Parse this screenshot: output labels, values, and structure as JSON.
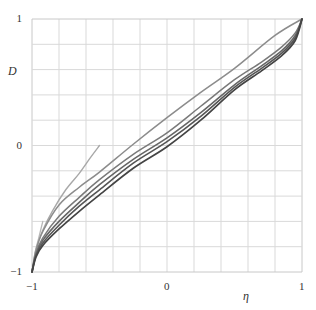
{
  "chart_data": {
    "type": "line",
    "title": "",
    "xlabel": "η",
    "ylabel": "D",
    "xlim": [
      -1,
      1
    ],
    "ylim": [
      -1,
      1
    ],
    "grid": true,
    "grid_divisions": {
      "x": 10,
      "y": 10
    },
    "x_ticks": [
      {
        "value": -1,
        "label": "−1"
      },
      {
        "value": 0,
        "label": "0"
      },
      {
        "value": 1,
        "label": "1"
      }
    ],
    "y_ticks": [
      {
        "value": -1,
        "label": "−1"
      },
      {
        "value": 0,
        "label": "0"
      },
      {
        "value": 1,
        "label": "1"
      }
    ],
    "legend": null,
    "series": [
      {
        "name": "curve-1",
        "color": "#b8b8b8",
        "width": 1.3,
        "points": [
          [
            -1,
            -1
          ],
          [
            -0.98,
            -0.86
          ],
          [
            -0.95,
            -0.73
          ],
          [
            -0.92,
            -0.6
          ]
        ]
      },
      {
        "name": "curve-2",
        "color": "#a8a8a8",
        "width": 1.4,
        "points": [
          [
            -1,
            -1
          ],
          [
            -0.97,
            -0.82
          ],
          [
            -0.92,
            -0.67
          ],
          [
            -0.85,
            -0.52
          ],
          [
            -0.75,
            -0.35
          ],
          [
            -0.65,
            -0.22
          ],
          [
            -0.57,
            -0.1
          ],
          [
            -0.5,
            0.0
          ]
        ]
      },
      {
        "name": "curve-3",
        "color": "#8c8c8c",
        "width": 1.5,
        "points": [
          [
            -1,
            -1
          ],
          [
            -0.97,
            -0.83
          ],
          [
            -0.92,
            -0.68
          ],
          [
            -0.8,
            -0.47
          ],
          [
            -0.65,
            -0.33
          ],
          [
            -0.5,
            -0.21
          ],
          [
            -0.25,
            0.01
          ],
          [
            0,
            0.22
          ],
          [
            0.25,
            0.42
          ],
          [
            0.5,
            0.61
          ],
          [
            0.8,
            0.87
          ],
          [
            1,
            1
          ]
        ]
      },
      {
        "name": "curve-4",
        "color": "#7a7a7a",
        "width": 1.5,
        "points": [
          [
            -1,
            -1
          ],
          [
            -0.97,
            -0.85
          ],
          [
            -0.92,
            -0.73
          ],
          [
            -0.8,
            -0.56
          ],
          [
            -0.65,
            -0.41
          ],
          [
            -0.5,
            -0.27
          ],
          [
            -0.25,
            -0.07
          ],
          [
            0,
            0.1
          ],
          [
            0.25,
            0.31
          ],
          [
            0.5,
            0.52
          ],
          [
            0.7,
            0.66
          ],
          [
            0.85,
            0.78
          ],
          [
            0.95,
            0.89
          ],
          [
            1,
            1
          ]
        ]
      },
      {
        "name": "curve-5",
        "color": "#666666",
        "width": 1.6,
        "points": [
          [
            -1,
            -1
          ],
          [
            -0.97,
            -0.86
          ],
          [
            -0.92,
            -0.75
          ],
          [
            -0.8,
            -0.6
          ],
          [
            -0.65,
            -0.45
          ],
          [
            -0.5,
            -0.31
          ],
          [
            -0.25,
            -0.11
          ],
          [
            0,
            0.06
          ],
          [
            0.25,
            0.26
          ],
          [
            0.5,
            0.48
          ],
          [
            0.7,
            0.63
          ],
          [
            0.85,
            0.75
          ],
          [
            0.95,
            0.87
          ],
          [
            1,
            1
          ]
        ]
      },
      {
        "name": "curve-6",
        "color": "#555555",
        "width": 1.6,
        "points": [
          [
            -1,
            -1
          ],
          [
            -0.97,
            -0.87
          ],
          [
            -0.92,
            -0.77
          ],
          [
            -0.8,
            -0.63
          ],
          [
            -0.65,
            -0.48
          ],
          [
            -0.5,
            -0.35
          ],
          [
            -0.25,
            -0.14
          ],
          [
            0,
            0.03
          ],
          [
            0.25,
            0.23
          ],
          [
            0.5,
            0.46
          ],
          [
            0.7,
            0.61
          ],
          [
            0.85,
            0.73
          ],
          [
            0.95,
            0.85
          ],
          [
            1,
            1
          ]
        ]
      },
      {
        "name": "curve-7",
        "color": "#444444",
        "width": 1.7,
        "points": [
          [
            -1,
            -1
          ],
          [
            -0.97,
            -0.88
          ],
          [
            -0.92,
            -0.79
          ],
          [
            -0.8,
            -0.66
          ],
          [
            -0.65,
            -0.52
          ],
          [
            -0.5,
            -0.39
          ],
          [
            -0.25,
            -0.18
          ],
          [
            0,
            -0.01
          ],
          [
            0.25,
            0.2
          ],
          [
            0.5,
            0.44
          ],
          [
            0.7,
            0.59
          ],
          [
            0.85,
            0.71
          ],
          [
            0.95,
            0.83
          ],
          [
            1,
            1
          ]
        ]
      }
    ]
  },
  "plot_area": {
    "left": 32,
    "top": 19,
    "right": 302,
    "bottom": 272
  },
  "colors": {
    "grid": "#d9d9d9",
    "frame": "#c8c8c8",
    "text": "#333333",
    "background": "#ffffff"
  }
}
